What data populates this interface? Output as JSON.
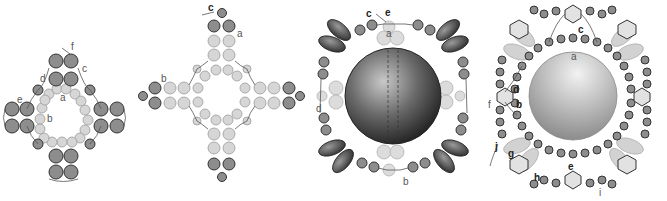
{
  "figures": [
    {
      "id": "step-1",
      "labels": [
        "a",
        "b",
        "c",
        "d",
        "e",
        "f"
      ]
    },
    {
      "id": "step-2",
      "labels": [
        "a",
        "b",
        "c"
      ]
    },
    {
      "id": "step-3",
      "labels": [
        "a",
        "b",
        "c",
        "d",
        "e"
      ]
    },
    {
      "id": "step-4",
      "labels": [
        "a",
        "b",
        "c",
        "d",
        "e",
        "f",
        "g",
        "h",
        "i",
        "j"
      ]
    }
  ],
  "colors": {
    "dark_bead": "#8a8a8a",
    "light_bead": "#d4d4d4",
    "bead_stroke": "#3a3a3a",
    "thread": "#555555",
    "big_bead_dark": "#2a2a2a",
    "big_bead_light": "#b8b8b8"
  }
}
